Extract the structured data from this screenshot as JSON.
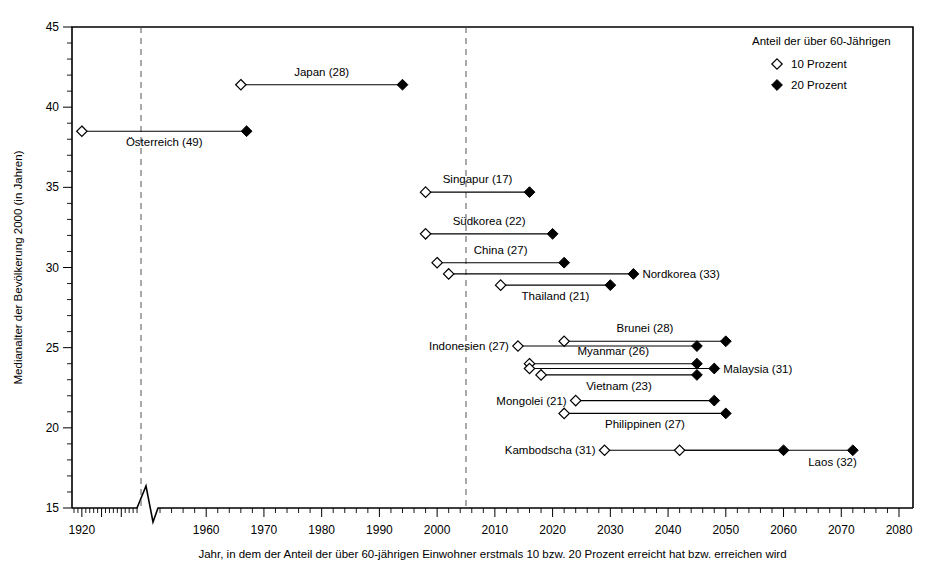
{
  "chart_data": {
    "type": "scatter",
    "title": "",
    "xlabel": "Jahr, in dem der Anteil der über 60-jährigen Einwohner erstmals 10 bzw. 20 Prozent erreicht hat bzw. erreichen wird",
    "ylabel": "Medianalter der Bevölkerung 2000 (in Jahren)",
    "xlim": [
      1915,
      2080
    ],
    "ylim": [
      15,
      45
    ],
    "x_ticks": [
      1920,
      1960,
      1970,
      1980,
      1990,
      2000,
      2010,
      2020,
      2030,
      2040,
      2050,
      2060,
      2070,
      2080
    ],
    "x_tick_labels": [
      "1920",
      "1960",
      "1970",
      "1980",
      "1990",
      "2000",
      "2010",
      "2020",
      "2030",
      "2040",
      "2050",
      "2060",
      "2070",
      "2080"
    ],
    "y_ticks": [
      15,
      20,
      25,
      30,
      35,
      40,
      45
    ],
    "y_tick_labels": [
      "15",
      "20",
      "25",
      "30",
      "35",
      "40",
      "45"
    ],
    "axis_break_year": 1950,
    "grid": false,
    "reference_lines": [
      {
        "name": "ref-line-1950",
        "x": 1950,
        "style": "dashed"
      },
      {
        "name": "ref-line-2005",
        "x": 2005,
        "style": "dashed"
      }
    ],
    "legend": {
      "position": "top-right",
      "title": "Anteil der über 60-Jährigen",
      "entries": [
        {
          "marker": "open-diamond",
          "label": "10 Prozent"
        },
        {
          "marker": "filled-diamond",
          "label": "20 Prozent"
        }
      ]
    },
    "series": [
      {
        "name": "Österreich",
        "label": "Österreich (49)",
        "median_age": 38.5,
        "year_10": 1920,
        "year_20": 1967,
        "label_pos": "below-center"
      },
      {
        "name": "Japan",
        "label": "Japan (28)",
        "median_age": 41.4,
        "year_10": 1966,
        "year_20": 1994,
        "label_pos": "above-center"
      },
      {
        "name": "Singapur",
        "label": "Singapur (17)",
        "median_age": 34.7,
        "year_10": 1998,
        "year_20": 2016,
        "label_pos": "above-center"
      },
      {
        "name": "Südkorea",
        "label": "Südkorea (22)",
        "median_age": 32.1,
        "year_10": 1998,
        "year_20": 2020,
        "label_pos": "above-center"
      },
      {
        "name": "China",
        "label": "China (27)",
        "median_age": 30.3,
        "year_10": 2000,
        "year_20": 2022,
        "label_pos": "above-center"
      },
      {
        "name": "Nordkorea",
        "label": "Nordkorea (33)",
        "median_age": 29.6,
        "year_10": 2002,
        "year_20": 2034,
        "label_pos": "right"
      },
      {
        "name": "Thailand",
        "label": "Thailand (21)",
        "median_age": 28.9,
        "year_10": 2011,
        "year_20": 2030,
        "label_pos": "below-center"
      },
      {
        "name": "Brunei",
        "label": "Brunei (28)",
        "median_age": 25.4,
        "year_10": 2022,
        "year_20": 2050,
        "label_pos": "above-center"
      },
      {
        "name": "Indonesien",
        "label": "Indonesien (27)",
        "median_age": 25.1,
        "year_10": 2014,
        "year_20": 2045,
        "label_pos": "left"
      },
      {
        "name": "Myanmar",
        "label": "Myanmar (26)",
        "median_age": 24.0,
        "year_10": 2016,
        "year_20": 2045,
        "label_pos": "above-center"
      },
      {
        "name": "Malaysia",
        "label": "Malaysia (31)",
        "median_age": 23.7,
        "year_10": 2016,
        "year_20": 2048,
        "label_pos": "right"
      },
      {
        "name": "Vietnam",
        "label": "Vietnam (23)",
        "median_age": 23.3,
        "year_10": 2018,
        "year_20": 2045,
        "label_pos": "below-center"
      },
      {
        "name": "Mongolei",
        "label": "Mongolei (21)",
        "median_age": 21.7,
        "year_10": 2024,
        "year_20": 2048,
        "label_pos": "left"
      },
      {
        "name": "Philippinen",
        "label": "Philippinen (27)",
        "median_age": 20.9,
        "year_10": 2022,
        "year_20": 2050,
        "label_pos": "below-center"
      },
      {
        "name": "Kambodscha",
        "label": "Kambodscha (31)",
        "median_age": 18.6,
        "year_10": 2029,
        "year_20": 2060,
        "label_pos": "left"
      },
      {
        "name": "Laos",
        "label": "Laos (32)",
        "median_age": 18.6,
        "year_10": 2042,
        "year_20": 2072,
        "label_pos": "below-right"
      }
    ]
  }
}
